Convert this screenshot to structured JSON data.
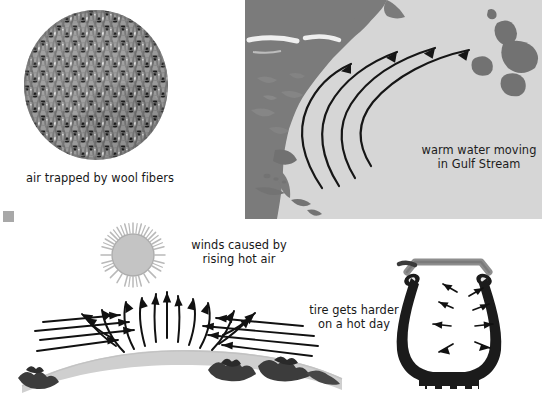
{
  "figure_set": {
    "background_color": "#ffffff",
    "width": 548,
    "height": 397
  },
  "panels": {
    "wool": {
      "name": "air trapped by wool fibers",
      "caption": "air trapped by wool fibers",
      "shape": "circle",
      "texture": "knitted wool fibers",
      "colors": {
        "fiber_mid": "#8f8f8f",
        "fiber_light": "#f0f0f0",
        "fiber_dark": "#1e1e1e"
      }
    },
    "gulf_stream": {
      "name": "Gulf Stream map",
      "caption": "warm water moving\nin Gulf Stream",
      "caption_line_1": "warm water moving",
      "caption_line_2": "in Gulf Stream",
      "arrow_count": 4,
      "arrow_description": "four curved arrows sweeping north-east from Florida past the Atlantic",
      "colors": {
        "ocean": "#d5d5d5",
        "land": "#7c7c7c",
        "arrow": "#111111"
      },
      "land_labels": [
        "North American east coast",
        "Florida peninsula",
        "Caribbean islands",
        "Bermuda / Azores islands"
      ]
    },
    "winds": {
      "name": "winds caused by rising hot air",
      "caption": "winds caused by\nrising hot air",
      "caption_line_1": "winds caused by",
      "caption_line_2": "rising hot air",
      "sun_label": "sun",
      "ground_label": "curved land surface",
      "left_arrow_count": 4,
      "right_arrow_count": 4,
      "rising_arrow_count": 13,
      "colors": {
        "sun_disc": "#c2c2c2",
        "sun_rays": "#b5b5b5",
        "ground": "#cfcfcf",
        "mountains": "#3a3a3a",
        "arrow": "#111111"
      }
    },
    "tire": {
      "name": "tire gets harder on a hot day",
      "caption": "tire gets harder\non a hot day",
      "caption_line_1": "tire gets harder",
      "caption_line_2": "on a hot day",
      "arrow_count": 8,
      "arrow_description": "pressure arrows pushing outward from inside the tire",
      "tread_notches": 4,
      "colors": {
        "tire_body": "#1b1b1b",
        "rim": "#8c8c8c",
        "arrow": "#111111"
      }
    }
  }
}
